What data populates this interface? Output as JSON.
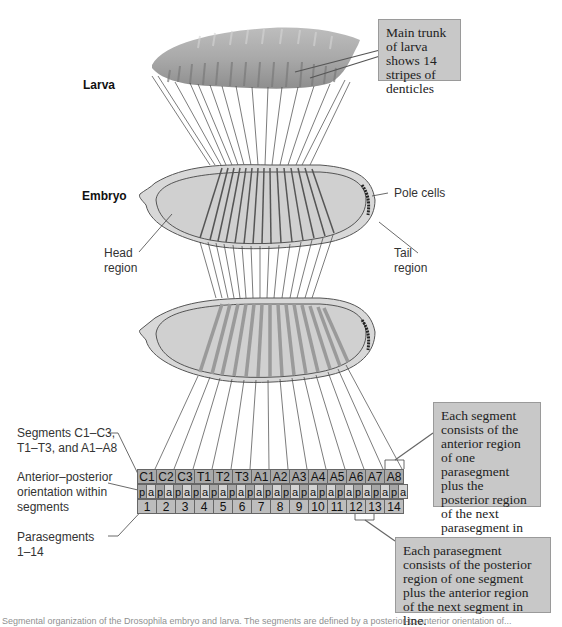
{
  "stages": {
    "larva_label": "Larva",
    "embryo_label": "Embryo"
  },
  "callouts": {
    "larva": "Main trunk of larva shows 14 stripes of denticles",
    "segment": "Each segment consists of the anterior region of one parasegment plus the posterior region of the next parasegment in line.",
    "parasegment": "Each parasegment consists of the posterior region of one segment plus the anterior region of the next segment in line."
  },
  "embryo_labels": {
    "pole_cells": "Pole cells",
    "head_region_1": "Head",
    "head_region_2": "region",
    "tail_region_1": "Tail",
    "tail_region_2": "region"
  },
  "legend_labels": {
    "segments_1": "Segments C1–C3,",
    "segments_2": "T1–T3, and A1–A8",
    "orientation_1": "Anterior–posterior",
    "orientation_2": "orientation within",
    "orientation_3": "segments",
    "parasegments_1": "Parasegments",
    "parasegments_2": "1–14"
  },
  "segments": [
    "C1",
    "C2",
    "C3",
    "T1",
    "T2",
    "T3",
    "A1",
    "A2",
    "A3",
    "A4",
    "A5",
    "A6",
    "A7",
    "A8"
  ],
  "orientation": {
    "posterior": "p",
    "anterior": "a"
  },
  "parasegments": [
    "1",
    "2",
    "3",
    "4",
    "5",
    "6",
    "7",
    "8",
    "9",
    "10",
    "11",
    "12",
    "13",
    "14"
  ],
  "caption": "Segmental organization of the Drosophila embryo and larva. The segments are defined by a posterior-to-anterior orientation of..."
}
